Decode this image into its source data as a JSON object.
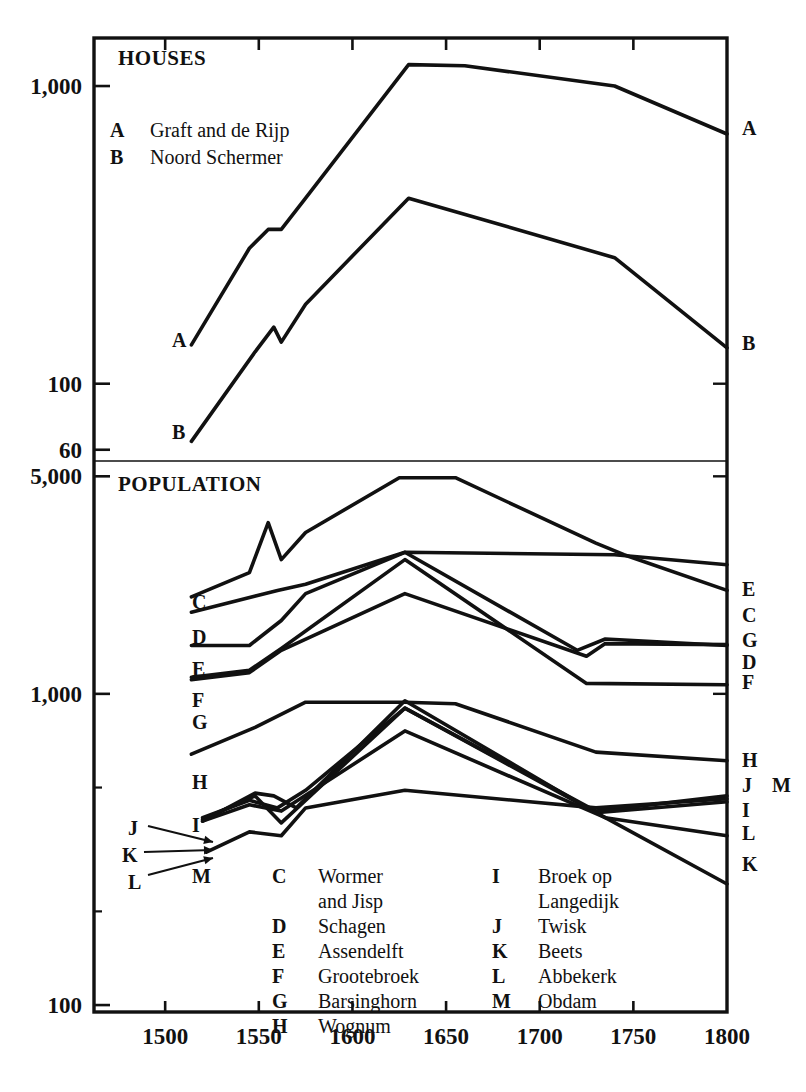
{
  "figure": {
    "panels": [
      {
        "id": "houses",
        "title": "HOUSES"
      },
      {
        "id": "population",
        "title": "POPULATION"
      }
    ]
  },
  "axes": {
    "x": {
      "label": "",
      "ticks": [
        1500,
        1550,
        1600,
        1650,
        1700,
        1750,
        1800
      ],
      "tick_labels": [
        "1500",
        "1550",
        "1600",
        "1650",
        "1700",
        "1750",
        "1800"
      ],
      "range": [
        1462,
        1800
      ]
    },
    "y_houses": {
      "scale": "log",
      "ticks": [
        1000,
        100,
        60
      ],
      "tick_labels": [
        "1,000",
        "100",
        "60"
      ],
      "range": [
        55,
        1450
      ]
    },
    "y_population": {
      "scale": "log",
      "ticks": [
        5000,
        1000,
        100
      ],
      "tick_labels": [
        "5,000",
        "1,000",
        "100"
      ],
      "range": [
        95,
        5600
      ]
    }
  },
  "inline_legend_houses": {
    "entries": [
      {
        "key": "A",
        "name": "Graft and de Rijp"
      },
      {
        "key": "B",
        "name": "Noord Schermer"
      }
    ]
  },
  "legend_population": {
    "column_left": [
      {
        "key": "C",
        "name": "Wormer",
        "name2": "and Jisp"
      },
      {
        "key": "D",
        "name": "Schagen",
        "name2": ""
      },
      {
        "key": "E",
        "name": "Assendelft",
        "name2": ""
      },
      {
        "key": "F",
        "name": "Grootebroek",
        "name2": ""
      },
      {
        "key": "G",
        "name": "Barsinghorn",
        "name2": ""
      },
      {
        "key": "H",
        "name": "Wognum",
        "name2": ""
      }
    ],
    "column_right": [
      {
        "key": "I",
        "name": "Broek op",
        "name2": "Langedijk"
      },
      {
        "key": "J",
        "name": "Twisk",
        "name2": ""
      },
      {
        "key": "K",
        "name": "Beets",
        "name2": ""
      },
      {
        "key": "L",
        "name": "Abbekerk",
        "name2": ""
      },
      {
        "key": "M",
        "name": "Obdam",
        "name2": ""
      }
    ]
  },
  "left_labels_houses": [
    "A",
    "B"
  ],
  "right_labels_houses": [
    "A",
    "B"
  ],
  "left_labels_population": [
    "C",
    "D",
    "E",
    "F",
    "G",
    "H",
    "I",
    "J",
    "K",
    "L",
    "M"
  ],
  "right_labels_population": [
    "E",
    "C",
    "G",
    "D",
    "F",
    "H",
    "J",
    "M",
    "I",
    "L",
    "K"
  ],
  "colors": {
    "ink": "#111111",
    "background": "#ffffff"
  },
  "chart_data": {
    "type": "line",
    "xlabel": "",
    "ylabel": "",
    "xlim": [
      1462,
      1800
    ],
    "grid": false,
    "legend_position": "inside",
    "panels": [
      {
        "id": "houses",
        "title": "HOUSES",
        "yscale": "log",
        "ylim": [
          55,
          1450
        ],
        "yticks": [
          60,
          100,
          1000
        ],
        "series": [
          {
            "name": "A",
            "label": "Graft and de Rijp",
            "x": [
              1514,
              1545,
              1555,
              1562,
              1575,
              1630,
              1660,
              1740,
              1800
            ],
            "values": [
              135,
              285,
              330,
              330,
              420,
              1180,
              1170,
              1000,
              690
            ]
          },
          {
            "name": "B",
            "label": "Noord Schermer",
            "x": [
              1514,
              1548,
              1558,
              1562,
              1575,
              1630,
              1740,
              1800
            ],
            "values": [
              64,
              128,
              155,
              138,
              185,
              420,
              265,
              132
            ]
          }
        ]
      },
      {
        "id": "population",
        "title": "POPULATION",
        "yscale": "log",
        "ylim": [
          95,
          5600
        ],
        "yticks": [
          100,
          1000,
          5000
        ],
        "series": [
          {
            "name": "C",
            "label": "Wormer and Jisp",
            "x": [
              1514,
              1545,
              1555,
              1562,
              1575,
              1625,
              1655,
              1730,
              1745,
              1800
            ],
            "values": [
              2050,
              2450,
              3550,
              2700,
              3300,
              4950,
              4950,
              3050,
              2800,
              2150
            ]
          },
          {
            "name": "D",
            "label": "Schagen",
            "x": [
              1514,
              1560,
              1575,
              1628,
              1720,
              1735,
              1800
            ],
            "values": [
              1830,
              2150,
              2250,
              2850,
              1380,
              1500,
              1430
            ]
          },
          {
            "name": "E",
            "label": "Assendelft",
            "x": [
              1514,
              1545,
              1562,
              1575,
              1628,
              1740,
              1800
            ],
            "values": [
              1430,
              1430,
              1720,
              2100,
              2850,
              2800,
              2600
            ]
          },
          {
            "name": "F",
            "label": "Grootebroek",
            "x": [
              1514,
              1545,
              1562,
              1628,
              1725,
              1800
            ],
            "values": [
              1130,
              1190,
              1400,
              2700,
              1080,
              1070
            ]
          },
          {
            "name": "G",
            "label": "Barsinghorn",
            "x": [
              1514,
              1545,
              1562,
              1628,
              1725,
              1735,
              1800
            ],
            "values": [
              1110,
              1170,
              1380,
              2100,
              1320,
              1450,
              1440
            ]
          },
          {
            "name": "H",
            "label": "Wognum",
            "x": [
              1514,
              1548,
              1575,
              1628,
              1655,
              1730,
              1800
            ],
            "values": [
              640,
              780,
              940,
              940,
              930,
              650,
              610
            ]
          },
          {
            "name": "I",
            "label": "Broek op Langedijk",
            "x": [
              1520,
              1548,
              1558,
              1570,
              1628,
              1730,
              1800
            ],
            "values": [
              390,
              480,
              470,
              430,
              950,
              415,
              450
            ]
          },
          {
            "name": "J",
            "label": "Twisk",
            "x": [
              1520,
              1545,
              1560,
              1575,
              1628,
              1730,
              1800
            ],
            "values": [
              400,
              455,
              430,
              490,
              900,
              420,
              470
            ]
          },
          {
            "name": "K",
            "label": "Beets",
            "x": [
              1520,
              1548,
              1562,
              1628,
              1735,
              1800
            ],
            "values": [
              395,
              470,
              385,
              900,
              400,
              245
            ]
          },
          {
            "name": "L",
            "label": "Abbekerk",
            "x": [
              1520,
              1545,
              1562,
              1628,
              1735,
              1800
            ],
            "values": [
              390,
              440,
              420,
              760,
              400,
              350
            ]
          },
          {
            "name": "M",
            "label": "Obdam",
            "x": [
              1522,
              1545,
              1562,
              1575,
              1628,
              1730,
              1800
            ],
            "values": [
              310,
              360,
              350,
              430,
              490,
              430,
              460
            ]
          }
        ]
      }
    ]
  }
}
